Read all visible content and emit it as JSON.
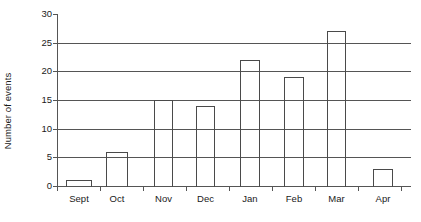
{
  "chart_data": {
    "type": "bar",
    "title": "",
    "xlabel": "",
    "ylabel": "Number of events",
    "categories": [
      "Sept",
      "Oct",
      "Nov",
      "Dec",
      "Jan",
      "Feb",
      "Mar",
      "Apr"
    ],
    "values": [
      1,
      6,
      15,
      14,
      22,
      19,
      27,
      3
    ],
    "ylim": [
      0,
      30
    ],
    "y_ticks": [
      0,
      5,
      10,
      15,
      20,
      25,
      30
    ],
    "y_tick_labels": [
      "0",
      "5",
      "10",
      "15",
      "20",
      "25",
      "30"
    ],
    "grid": true,
    "grid_axis": "y",
    "legend": null,
    "series": [
      {
        "name": "Number of events",
        "values": [
          1,
          6,
          15,
          14,
          22,
          19,
          27,
          3
        ]
      }
    ],
    "bar_style": {
      "fill": "none",
      "edge_color": "#4a4a4a"
    },
    "axis_color": "#555555",
    "background": "#ffffff"
  },
  "axes": {
    "y_title": "Number of events"
  }
}
